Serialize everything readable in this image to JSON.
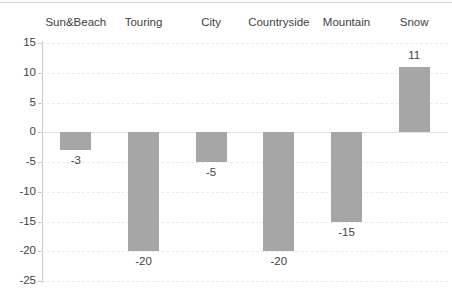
{
  "chart_data": {
    "type": "bar",
    "title": "",
    "subtitle": "",
    "xlabel": "",
    "ylabel": "",
    "categories": [
      "Sun&Beach",
      "Touring",
      "City",
      "Countryside",
      "Mountain",
      "Snow"
    ],
    "values": [
      -3,
      -20,
      -5,
      -20,
      -15,
      11
    ],
    "data_labels": [
      "-3",
      "-20",
      "-5",
      "-20",
      "-15",
      "11"
    ],
    "ylim": [
      -25,
      15
    ],
    "ytick_step": 5,
    "yticks": [
      15,
      10,
      5,
      0,
      -5,
      -10,
      -15,
      -20,
      -25
    ],
    "ytick_labels": [
      "15",
      "10",
      "5",
      "0",
      "-5",
      "-10",
      "-15",
      "-20",
      "-25"
    ],
    "grid": "horizontal-dashed",
    "legend": "none",
    "category_labels_position": "top",
    "bar_color": "#a6a6a6",
    "gridline_color": "#ebebeb",
    "axis_color": "#c8c8c8",
    "text_color": "#3f3f3f"
  }
}
